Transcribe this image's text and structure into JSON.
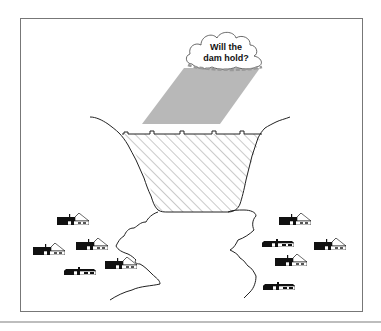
{
  "diagram": {
    "cloud": {
      "line1": "Will the",
      "line2": "dam hold?"
    },
    "elements": {
      "rain": "rain-shaft",
      "reservoir": "hatched-reservoir",
      "dam": "dam-wall",
      "river": "downstream-river",
      "houses_left_count": 5,
      "houses_right_count": 5
    },
    "colors": {
      "rain": "#b8b8b8",
      "line": "#222222",
      "house": "#111111",
      "frame": "#777777"
    }
  }
}
